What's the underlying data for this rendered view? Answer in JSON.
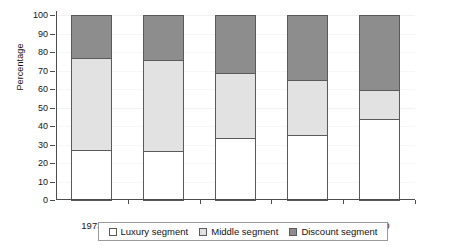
{
  "chart_data": {
    "type": "bar",
    "subtype": "stacked-percentage",
    "title": "",
    "xlabel": "",
    "ylabel": "Percentage",
    "ylim": [
      0,
      100
    ],
    "y_ticks": [
      0,
      10,
      20,
      30,
      40,
      50,
      60,
      70,
      80,
      90,
      100
    ],
    "y_tick_labels": [
      "0",
      "10",
      "20",
      "30",
      "40",
      "50",
      "60",
      "70",
      "80",
      "90",
      "100"
    ],
    "grid": true,
    "legend_position": "bottom",
    "categories": [
      "1973",
      "1981",
      "1986",
      "1990",
      "2010"
    ],
    "series": [
      {
        "name": "Luxury segment",
        "color": "#ffffff",
        "values": [
          27,
          26.5,
          33.5,
          35,
          44
        ]
      },
      {
        "name": "Middle segment",
        "color": "#e2e2e2",
        "values": [
          50,
          49,
          35,
          30,
          15.5
        ]
      },
      {
        "name": "Discount segment",
        "color": "#8d8d8d",
        "values": [
          23,
          24.5,
          31.5,
          35,
          40.5
        ]
      }
    ],
    "cumulative_tops": {
      "Luxury segment": [
        27,
        26.5,
        33.5,
        35,
        44
      ],
      "Middle segment": [
        77,
        75.5,
        68.5,
        65,
        59.5
      ],
      "Discount segment": [
        100,
        100,
        100,
        100,
        100
      ]
    }
  },
  "legend": {
    "items": [
      {
        "label": "Luxury segment",
        "swatch": "legend-swatch-luxury"
      },
      {
        "label": "Middle segment",
        "swatch": "legend-swatch-middle"
      },
      {
        "label": "Discount segment",
        "swatch": "legend-swatch-discount"
      }
    ]
  }
}
